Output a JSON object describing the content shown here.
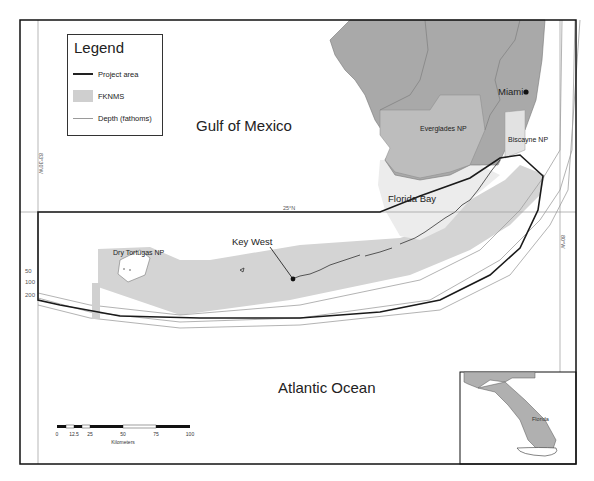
{
  "legend": {
    "title": "Legend",
    "items": [
      {
        "label": "Project area",
        "symbol": "thick-black-line"
      },
      {
        "label": "FKNMS",
        "symbol": "gray-fill"
      },
      {
        "label": "Depth (fathoms)",
        "symbol": "thin-gray-line"
      }
    ]
  },
  "water_labels": {
    "gulf": "Gulf of Mexico",
    "atlantic": "Atlantic Ocean"
  },
  "place_labels": {
    "miami": "Miami",
    "key_west": "Key West",
    "florida_bay": "Florida Bay",
    "everglades": "Everglades NP",
    "biscayne": "Biscayne NP",
    "dry_tortugas": "Dry Tortugas NP"
  },
  "grid_labels": {
    "lat_25": "25°N",
    "lon_83_30": "83°30'W",
    "lon_80": "80°W"
  },
  "depth_labels": [
    "50",
    "100",
    "200"
  ],
  "scale_bar": {
    "ticks": [
      "0",
      "12.5",
      "25",
      "50",
      "75",
      "100"
    ],
    "unit": "Kilometers"
  },
  "inset": {
    "label": "Florida"
  },
  "colors": {
    "land": "#a9a9a9",
    "park": "#bdbdbd",
    "fknms": "#d4d4d4",
    "project_line": "#1a1a1a",
    "depth_line": "#a0a0a0",
    "grid": "#9a9a9a",
    "frame": "#111111"
  }
}
